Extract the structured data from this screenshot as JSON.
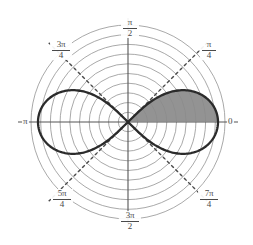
{
  "figure": {
    "kind": "polar-plot",
    "background_color": "#ffffff",
    "curve_color": "#2b2b2b",
    "grid_color": "#8c8c8c",
    "axis_color": "#555555",
    "ray_color": "#4a4a4a",
    "shade_color": "#8a8a8a",
    "label_color": "#4a4a4a"
  },
  "angle_labels": {
    "right": "0",
    "upper_right_num": "π",
    "upper_right_den": "4",
    "top_num": "π",
    "top_den": "2",
    "upper_left_num": "3π",
    "upper_left_den": "4",
    "left": "π",
    "lower_left_num": "5π",
    "lower_left_den": "4",
    "bottom_num": "3π",
    "bottom_den": "2",
    "lower_right_num": "7π",
    "lower_right_den": "4"
  },
  "chart_data": {
    "type": "line",
    "plot_style": "polar",
    "title": "",
    "xlabel": "",
    "ylabel": "",
    "equation": "r^2 = cos(2θ)",
    "curve_name": "lemniscate",
    "theta_tick_labels": [
      "0",
      "π/4",
      "π/2",
      "3π/4",
      "π",
      "5π/4",
      "3π/2",
      "7π/4"
    ],
    "theta_ticks_deg": [
      0,
      45,
      90,
      135,
      180,
      225,
      270,
      315
    ],
    "radial_grid_circles": 10,
    "radial_max": 1.0,
    "shaded_region": {
      "label": "area swept from θ = 0 to θ = π/4",
      "theta_start_deg": 0,
      "theta_end_deg": 45,
      "closed_to_x_axis": true
    },
    "series": [
      {
        "name": "r = sqrt(cos(2θ))",
        "theta_deg": [
          0,
          5,
          10,
          15,
          20,
          25,
          30,
          35,
          40,
          45,
          315,
          320,
          325,
          330,
          335,
          340,
          345,
          350,
          355,
          360
        ],
        "r": [
          1.0,
          0.994,
          0.985,
          0.966,
          0.94,
          0.906,
          0.866,
          0.819,
          0.766,
          0.0,
          0.0,
          0.766,
          0.819,
          0.866,
          0.906,
          0.94,
          0.966,
          0.985,
          0.994,
          1.0
        ]
      },
      {
        "name": "r = sqrt(cos(2θ)) (left lobe)",
        "theta_deg": [
          135,
          140,
          145,
          150,
          155,
          160,
          165,
          170,
          175,
          180,
          185,
          190,
          195,
          200,
          205,
          210,
          215,
          220,
          225
        ],
        "r": [
          0.0,
          0.766,
          0.819,
          0.866,
          0.906,
          0.94,
          0.966,
          0.985,
          0.994,
          1.0,
          0.994,
          0.985,
          0.966,
          0.94,
          0.906,
          0.866,
          0.819,
          0.766,
          0.0
        ]
      }
    ]
  }
}
